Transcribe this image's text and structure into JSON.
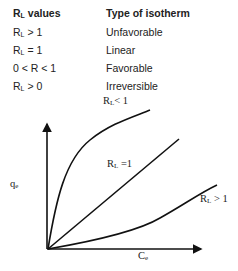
{
  "table": {
    "headers": {
      "col1_main": "R",
      "col1_sub": "L",
      "col1_rest": " values",
      "col2": "Type of isotherm"
    },
    "rows": [
      {
        "main": "R",
        "sub": "L",
        "rest": " > 1",
        "type": "Unfavorable"
      },
      {
        "main": "R",
        "sub": "L",
        "rest": " = 1",
        "type": "Linear"
      },
      {
        "main": "0 < R < 1",
        "sub": "",
        "rest": "",
        "type": "Favorable"
      },
      {
        "main": "R",
        "sub": "L",
        "rest": " > 0",
        "type": "Irreversible"
      }
    ]
  },
  "graph": {
    "ylabel_main": "q",
    "ylabel_sub": "e",
    "xlabel_main": "C",
    "xlabel_sub": "e",
    "curves": [
      {
        "name": "favorable",
        "label_main": "R",
        "label_sub": "L",
        "label_rest": "< 1"
      },
      {
        "name": "linear",
        "label_main": "R",
        "label_sub": "L",
        "label_rest": " =1"
      },
      {
        "name": "unfavorable",
        "label_main": "R",
        "label_sub": "L",
        "label_rest": " > 1"
      }
    ]
  }
}
